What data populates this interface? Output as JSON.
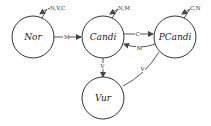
{
  "diagram": {
    "type": "state-transition",
    "nodes": [
      {
        "id": "nor",
        "label": "Nor",
        "cx": 33,
        "cy": 37,
        "r": 21
      },
      {
        "id": "candi",
        "label": "Candi",
        "cx": 103,
        "cy": 37,
        "r": 21
      },
      {
        "id": "pcandi",
        "label": "PCandi",
        "cx": 175,
        "cy": 37,
        "r": 21
      },
      {
        "id": "vur",
        "label": "Vur",
        "cx": 103,
        "cy": 98,
        "r": 21
      }
    ],
    "edges": [
      {
        "from": "nor",
        "to": "nor",
        "label": "N,V,C"
      },
      {
        "from": "nor",
        "to": "candi",
        "label": "M"
      },
      {
        "from": "candi",
        "to": "candi",
        "label": "N,M"
      },
      {
        "from": "candi",
        "to": "pcandi",
        "label": "C"
      },
      {
        "from": "pcandi",
        "to": "candi",
        "label": "M"
      },
      {
        "from": "pcandi",
        "to": "pcandi",
        "label": "C,N"
      },
      {
        "from": "candi",
        "to": "vur",
        "label": "V"
      },
      {
        "from": "pcandi",
        "to": "vur",
        "label": "V"
      }
    ]
  }
}
